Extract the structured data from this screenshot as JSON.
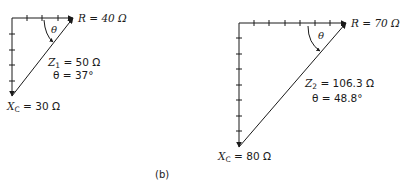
{
  "figure_label": "(b)",
  "diagrams": [
    {
      "id": "left",
      "R_label": "R = 40 Ω",
      "theta_symbol": "θ",
      "Z_symbol": "Z",
      "Z_subscript": "1",
      "Z_value": " = 50 Ω",
      "theta_label": "θ = 37°",
      "Xc_symbol": "X",
      "Xc_subscript": "C",
      "Xc_value": " = 30 Ω"
    },
    {
      "id": "right",
      "R_label": "R = 70 Ω",
      "theta_symbol": "θ",
      "Z_symbol": "Z",
      "Z_subscript": "2",
      "Z_value": " = 106.3 Ω",
      "theta_label": "θ = 48.8°",
      "Xc_symbol": "X",
      "Xc_subscript": "C",
      "Xc_value": " = 80 Ω"
    }
  ],
  "colors": {
    "line": "#1a1a1a",
    "background": "#ffffff"
  }
}
